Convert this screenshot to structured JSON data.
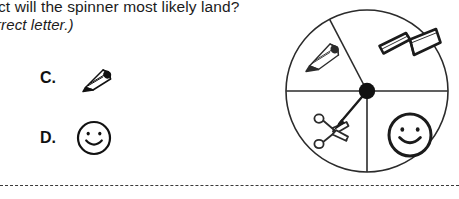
{
  "question": {
    "line1": "ct will the spinner most likely land?",
    "line2": "rrect letter.)"
  },
  "options": [
    {
      "letter": "C.",
      "icon": "pencil-icon",
      "label": "pencil"
    },
    {
      "letter": "D.",
      "icon": "smiley-face-icon",
      "label": "smiley face"
    }
  ],
  "spinner": {
    "name": "four-section-spinner",
    "sections": [
      {
        "position": "upper-left",
        "icon": "pencil-icon",
        "label": "pencil"
      },
      {
        "position": "upper-right",
        "icon": "open-book-icon",
        "label": "open book"
      },
      {
        "position": "lower-left",
        "icon": "scissors-icon",
        "label": "scissors"
      },
      {
        "position": "lower-right",
        "icon": "smiley-face-icon",
        "label": "smiley face"
      }
    ],
    "pointer": {
      "name": "spinner-arrow",
      "points_to": "scissors"
    },
    "hub": {
      "name": "spinner-hub"
    }
  },
  "separator": {
    "name": "dashed-separator",
    "style": "dashed"
  },
  "colors": {
    "ink": "#1b1b1b",
    "line": "#2b2b2b",
    "dashed": "#3a3a3a",
    "background": "#ffffff"
  }
}
